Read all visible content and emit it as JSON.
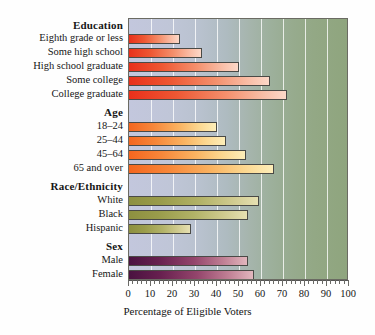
{
  "chart_data": {
    "type": "bar",
    "orientation": "horizontal",
    "title": "",
    "xlabel": "Percentage of Eligible Voters",
    "ylabel": "",
    "xlim": [
      0,
      100
    ],
    "xticks": [
      0,
      10,
      20,
      30,
      40,
      50,
      60,
      70,
      80,
      90,
      100
    ],
    "xtick_labels": [
      "0",
      "10",
      "20",
      "30",
      "40",
      "50",
      "60",
      "70",
      "80",
      "90",
      "100"
    ],
    "grid": true,
    "grid_axis": "x",
    "legend": "none",
    "groups": [
      {
        "name": "Education",
        "color": "#e8301b",
        "categories": [
          "Eighth grade or less",
          "Some high school",
          "High school graduate",
          "Some college",
          "College graduate"
        ],
        "values": [
          23,
          33,
          50,
          64,
          72
        ]
      },
      {
        "name": "Age",
        "color": "#f4661f",
        "categories": [
          "18–24",
          "25–44",
          "45–64",
          "65 and over"
        ],
        "values": [
          40,
          44,
          53,
          66
        ]
      },
      {
        "name": "Race/Ethnicity",
        "color": "#8d9040",
        "categories": [
          "White",
          "Black",
          "Hispanic"
        ],
        "values": [
          59,
          54,
          28
        ]
      },
      {
        "name": "Sex",
        "color": "#4a1240",
        "categories": [
          "Male",
          "Female"
        ],
        "values": [
          54,
          57
        ]
      }
    ]
  },
  "axis": {
    "x_title": "Percentage of Eligible Voters",
    "tick_labels": [
      "0",
      "10",
      "20",
      "30",
      "40",
      "50",
      "60",
      "70",
      "80",
      "90",
      "100"
    ]
  },
  "group_headings": {
    "education": "Education",
    "age": "Age",
    "race_ethnicity": "Race/Ethnicity",
    "sex": "Sex"
  },
  "row_labels": {
    "eighth_grade_or_less": "Eighth grade or less",
    "some_high_school": "Some high school",
    "high_school_graduate": "High school graduate",
    "some_college": "Some college",
    "college_graduate": "College graduate",
    "age_18_24": "18–24",
    "age_25_44": "25–44",
    "age_45_64": "45–64",
    "age_65_and_over": "65 and over",
    "white": "White",
    "black": "Black",
    "hispanic": "Hispanic",
    "male": "Male",
    "female": "Female"
  },
  "colors": {
    "education_bar": "#e8301b",
    "age_bar": "#f4661f",
    "race_bar": "#8d9040",
    "sex_bar": "#4a1240",
    "plot_background_left": "#c3c7dd",
    "plot_background_right": "#8fa57e",
    "gridline": "#ffffff",
    "axis_line": "#555555",
    "text": "#151515"
  }
}
